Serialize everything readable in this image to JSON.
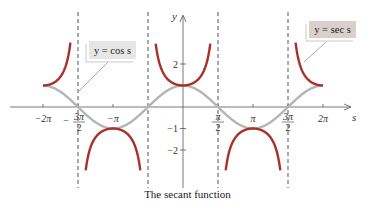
{
  "chart_data": {
    "type": "line",
    "title": "The secant function",
    "xlabel": "s",
    "ylabel": "y",
    "xlim": [
      -6.9,
      7.5
    ],
    "ylim": [
      -3.1,
      3.2
    ],
    "grid": false,
    "x_ticks": [
      {
        "value": -6.2832,
        "label": "−2π"
      },
      {
        "value": -4.7124,
        "label": "−3π/2"
      },
      {
        "value": -3.1416,
        "label": "−π"
      },
      {
        "value": 1.5708,
        "label": "π/2"
      },
      {
        "value": 3.1416,
        "label": "π"
      },
      {
        "value": 4.7124,
        "label": "3π/2"
      },
      {
        "value": 6.2832,
        "label": "2π"
      }
    ],
    "y_ticks": [
      {
        "value": 2,
        "label": "2"
      },
      {
        "value": -1,
        "label": "−1"
      },
      {
        "value": -2,
        "label": "−2"
      }
    ],
    "asymptotes": [
      -4.7124,
      -1.5708,
      1.5708,
      4.7124
    ],
    "series": [
      {
        "name": "y = cos s",
        "color": "#b5b5b5",
        "function": "cos",
        "domain": [
          -6.2832,
          6.2832
        ]
      },
      {
        "name": "y = sec s",
        "color": "#a8312a",
        "function": "sec",
        "domain": [
          -6.2832,
          6.2832
        ],
        "clip_y": [
          -3.0,
          3.0
        ]
      }
    ],
    "annotations": [
      {
        "text": "y = cos s",
        "box_color": "#e6e6e6",
        "points_to": "cos curve near s = −3π/2"
      },
      {
        "text": "y = sec s",
        "box_color": "#d9cfcd",
        "points_to": "sec curve near s = 3π/2"
      }
    ],
    "legend_position": "callout boxes"
  },
  "labels": {
    "y_axis": "y",
    "x_axis": "s",
    "cos_box": "y = cos s",
    "sec_box": "y = sec s",
    "caption": "The secant function"
  },
  "colors": {
    "sec_curve": "#a8312a",
    "cos_curve": "#b5b5b5",
    "axis": "#555555",
    "asymptote": "#555555",
    "cos_box_fill": "#e6e6e6",
    "sec_box_fill": "#d9cfcd"
  }
}
